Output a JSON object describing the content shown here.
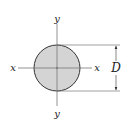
{
  "figure": {
    "shape": "solid circular cross-section",
    "fill_color": "#d4d4d4",
    "stroke_color": "#333333",
    "axis_labels": {
      "top": "y",
      "bottom": "y",
      "left": "x",
      "right": "x"
    },
    "dimension": {
      "label": "D",
      "meaning": "diameter"
    }
  }
}
